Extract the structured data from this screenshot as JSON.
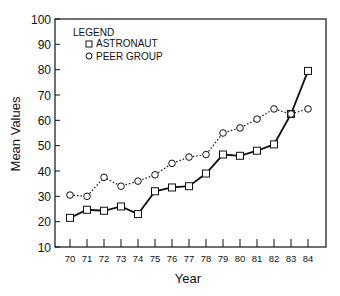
{
  "chart_data": {
    "type": "line",
    "title": "",
    "xlabel": "Year",
    "ylabel": "Mean Values",
    "ylim": [
      10,
      100
    ],
    "yticks": [
      10,
      20,
      30,
      40,
      50,
      60,
      70,
      80,
      90,
      100
    ],
    "categories": [
      "70",
      "71",
      "72",
      "73",
      "74",
      "75",
      "76",
      "77",
      "78",
      "79",
      "80",
      "81",
      "82",
      "83",
      "84"
    ],
    "grid": false,
    "legend": {
      "title": "LEGEND",
      "position": "upper-left",
      "entries": [
        {
          "label": "ASTRONAUT",
          "marker": "square",
          "line": "solid"
        },
        {
          "label": "PEER GROUP",
          "marker": "circle",
          "line": "dotted"
        }
      ]
    },
    "series": [
      {
        "name": "ASTRONAUT",
        "marker": "square",
        "line": "solid",
        "color": "#111111",
        "values": [
          21.5,
          24.7,
          24.3,
          26,
          23,
          32,
          33.5,
          34,
          39,
          46.5,
          46,
          48,
          50.5,
          62.5,
          79.5
        ]
      },
      {
        "name": "PEER GROUP",
        "marker": "circle",
        "line": "dotted",
        "color": "#111111",
        "values": [
          30.5,
          30,
          37.5,
          34,
          36,
          38.5,
          43,
          45.5,
          46.5,
          55,
          57,
          60.5,
          64.5,
          62.5,
          64.5
        ]
      }
    ]
  }
}
